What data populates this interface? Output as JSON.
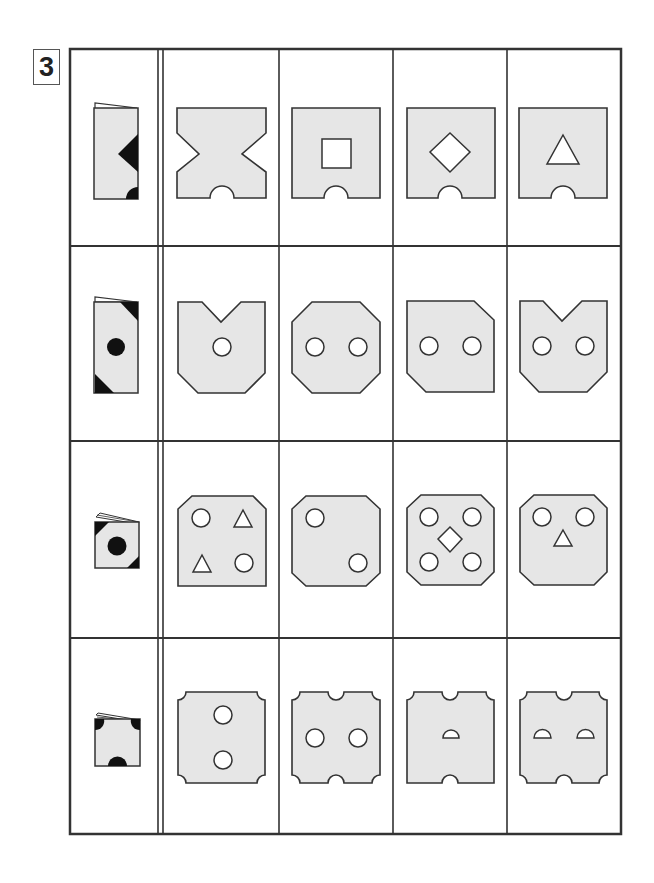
{
  "puzzle": {
    "number": "3",
    "type": "paper-folding-and-punching",
    "fill_color": "#e6e6e6",
    "stroke_color": "#333333",
    "punch_color": "#111111",
    "rows": [
      {
        "folded": {
          "shape": "tall-rect",
          "cutouts": [
            "right-edge-triangle",
            "bottom-right-half-circle"
          ]
        },
        "options": [
          {
            "label": "A",
            "shape": "X-cut square (side V-notches) with bottom semicircle notch"
          },
          {
            "label": "B",
            "shape": "square with center square hole and bottom semicircle notch"
          },
          {
            "label": "C",
            "shape": "square with center diamond hole and bottom semicircle notch"
          },
          {
            "label": "D",
            "shape": "square with center triangle hole and bottom semicircle notch"
          }
        ]
      },
      {
        "folded": {
          "shape": "tall-rect",
          "cutouts": [
            "top-right-corner-triangle",
            "center-circle",
            "bottom-left-corner-triangle"
          ]
        },
        "options": [
          {
            "label": "A",
            "shape": "top V-notch, cut bottom corners, one center circle"
          },
          {
            "label": "B",
            "shape": "octagon with two circles"
          },
          {
            "label": "C",
            "shape": "cut top-right and bottom-left corners, two circles"
          },
          {
            "label": "D",
            "shape": "top V-notch, cut bottom corners, two circles"
          }
        ]
      },
      {
        "folded": {
          "shape": "small-square",
          "cutouts": [
            "top-left-corner-triangle",
            "center-circle",
            "bottom-right-corner-triangle"
          ]
        },
        "options": [
          {
            "label": "A",
            "shape": "cut top corners, circles TL/BR, triangles TR/BL"
          },
          {
            "label": "B",
            "shape": "octagon, circles TL and BR"
          },
          {
            "label": "C",
            "shape": "octagon, four circles and center diamond"
          },
          {
            "label": "D",
            "shape": "octagon, two top circles and center triangle"
          }
        ]
      },
      {
        "folded": {
          "shape": "small-square",
          "cutouts": [
            "top-left-quarter-circle",
            "top-right-quarter-circle",
            "bottom-center-half-circle"
          ]
        },
        "options": [
          {
            "label": "A",
            "shape": "rounded-notch corners, two vertical circles"
          },
          {
            "label": "B",
            "shape": "rounded-notch corners, top/bottom notches, two horizontal circles"
          },
          {
            "label": "C",
            "shape": "top/bottom notches, rounded top-right corner, one semicircle hole"
          },
          {
            "label": "D",
            "shape": "rounded-notch corners, top/bottom notches, two semicircle holes"
          }
        ]
      }
    ]
  }
}
